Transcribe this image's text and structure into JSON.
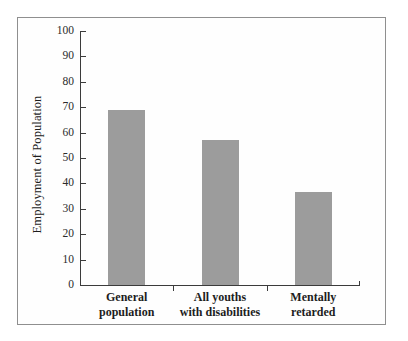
{
  "chart_data": {
    "type": "bar",
    "title": "",
    "subtitle": "",
    "xlabel": "",
    "ylabel": "Employment of Population",
    "categories": [
      "General population",
      "All youths with disabilities",
      "Mentally retarded"
    ],
    "category_lines": [
      [
        "General",
        "population"
      ],
      [
        "All youths",
        "with disabilities"
      ],
      [
        "Mentally",
        "retarded"
      ]
    ],
    "values": [
      69,
      57,
      36.5
    ],
    "ylim": [
      0,
      100
    ],
    "ytick_step": 10,
    "yticks": [
      100,
      90,
      80,
      70,
      60,
      50,
      40,
      30,
      20,
      10,
      0
    ],
    "ytick_labels": [
      "100",
      "90",
      "80",
      "70",
      "60",
      "50",
      "40",
      "30",
      "20",
      "10",
      "0"
    ],
    "grid": false,
    "legend": null,
    "bar_color": "#9c9c9c",
    "axis_color": "#3b3b3b",
    "frame_color": "#8f8f8f",
    "background_color": "#fefefe"
  }
}
